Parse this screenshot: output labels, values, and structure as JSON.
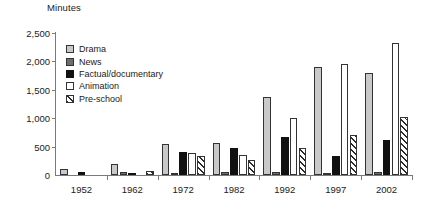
{
  "chart_data": {
    "type": "bar",
    "title": "",
    "ylabel": "Minutes",
    "xlabel": "",
    "ylim": [
      0,
      2500
    ],
    "yticks": [
      "0",
      "500",
      "1,000",
      "1,500",
      "2,000",
      "2,500"
    ],
    "ytick_values": [
      0,
      500,
      1000,
      1500,
      2000,
      2500
    ],
    "grid": false,
    "legend_position": "upper-left-inside",
    "categories": [
      "1952",
      "1962",
      "1972",
      "1982",
      "1992",
      "1997",
      "2002"
    ],
    "series": [
      {
        "name": "Drama",
        "key": "drama",
        "color": "#c9c9c9",
        "values": [
          100,
          200,
          550,
          555,
          1370,
          1900,
          1800
        ]
      },
      {
        "name": "News",
        "key": "news",
        "color": "#6e6e6e",
        "values": [
          0,
          60,
          30,
          60,
          60,
          30,
          60
        ]
      },
      {
        "name": "Factual/documentary",
        "key": "factual",
        "color": "#111111",
        "values": [
          50,
          30,
          400,
          480,
          670,
          330,
          620
        ]
      },
      {
        "name": "Animation",
        "key": "animation",
        "color": "#ffffff",
        "values": [
          0,
          0,
          380,
          350,
          1000,
          1960,
          2330
        ]
      },
      {
        "name": "Pre-school",
        "key": "preschool",
        "color": "hatch",
        "values": [
          0,
          70,
          330,
          270,
          480,
          710,
          1020
        ]
      }
    ]
  },
  "legend": {
    "items": [
      {
        "label": "Drama"
      },
      {
        "label": "News"
      },
      {
        "label": "Factual/documentary"
      },
      {
        "label": "Animation"
      },
      {
        "label": "Pre-school"
      }
    ]
  }
}
